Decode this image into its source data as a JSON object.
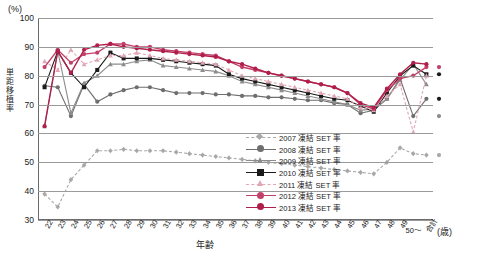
{
  "axis": {
    "y_unit": "(%)",
    "y_title": "単距移植率",
    "x_title": "年齢",
    "x_unit": "(歳)",
    "y_ticks": [
      "100",
      "90",
      "80",
      "70",
      "60",
      "50",
      "40",
      "30"
    ],
    "x_ticks": [
      "22",
      "23",
      "24",
      "25",
      "26",
      "27",
      "28",
      "29",
      "30",
      "31",
      "32",
      "33",
      "34",
      "35",
      "36",
      "37",
      "38",
      "39",
      "40",
      "41",
      "42",
      "43",
      "44",
      "45",
      "46",
      "47",
      "48",
      "49",
      "50～",
      "合計"
    ]
  },
  "legend": [
    {
      "label": "2007 凍結 SET 率",
      "color": "#a8a8a8",
      "marker": "diamond",
      "dash": "3 2"
    },
    {
      "label": "2008 凍結 SET 率",
      "color": "#6e6e6e",
      "marker": "circle",
      "dash": "none"
    },
    {
      "label": "2009 凍結 SET 率",
      "color": "#8c8c8c",
      "marker": "triangle",
      "dash": "none"
    },
    {
      "label": "2010 凍結 SET 率",
      "color": "#1a1a1a",
      "marker": "square",
      "dash": "none"
    },
    {
      "label": "2011 凍結 SET 率",
      "color": "#e0a6b4",
      "marker": "triangle",
      "dash": "3 2"
    },
    {
      "label": "2012 凍結 SET 率",
      "color": "#c2406a",
      "marker": "circle",
      "dash": "none"
    },
    {
      "label": "2013 凍結 SET 率",
      "color": "#b01f4a",
      "marker": "circle",
      "dash": "none"
    }
  ],
  "chart_data": {
    "type": "line",
    "title": "",
    "xlabel": "年齢",
    "ylabel": "単距移植率",
    "ylim": [
      30,
      100
    ],
    "grid": true,
    "legend_position": "inside-lower-right",
    "categories": [
      "22",
      "23",
      "24",
      "25",
      "26",
      "27",
      "28",
      "29",
      "30",
      "31",
      "32",
      "33",
      "34",
      "35",
      "36",
      "37",
      "38",
      "39",
      "40",
      "41",
      "42",
      "43",
      "44",
      "45",
      "46",
      "47",
      "48",
      "49",
      "50～",
      "合計"
    ],
    "series": [
      {
        "name": "2007 凍結 SET 率",
        "color": "#a8a8a8",
        "values": [
          39,
          34.5,
          44,
          49,
          54,
          54,
          54.5,
          54,
          54,
          54,
          53.5,
          53,
          52.5,
          52,
          51.5,
          51,
          50.5,
          50,
          49.5,
          49,
          48.5,
          48,
          47.5,
          47,
          46.5,
          46,
          50,
          55,
          53,
          52.5
        ]
      },
      {
        "name": "2008 凍結 SET 率",
        "color": "#6e6e6e",
        "values": [
          76.5,
          76,
          66,
          77,
          71,
          73.5,
          75,
          76,
          76,
          75,
          74,
          74,
          74,
          73.5,
          73.5,
          73,
          73,
          72.5,
          72.5,
          72,
          71.5,
          71.5,
          70.5,
          70,
          67,
          68,
          72,
          79,
          66,
          72
        ]
      },
      {
        "name": "2009 凍結 SET 率",
        "color": "#8c8c8c",
        "values": [
          62.5,
          88.5,
          67,
          77.5,
          80,
          84,
          84,
          85,
          85.5,
          83.5,
          83,
          82.5,
          82,
          81.5,
          80,
          78,
          77,
          76,
          75,
          74,
          73,
          72,
          71,
          70,
          68,
          68.5,
          72,
          78.5,
          84,
          77
        ]
      },
      {
        "name": "2010 凍結 SET 率",
        "color": "#1a1a1a",
        "values": [
          76,
          88.5,
          81,
          76,
          82,
          88,
          86,
          86,
          86,
          85.5,
          85,
          84.5,
          84,
          83.5,
          80.5,
          79,
          78,
          77,
          76,
          75,
          74,
          73,
          72,
          71.5,
          69.5,
          67.5,
          74,
          80,
          83.5,
          80.5
        ]
      },
      {
        "name": "2011 凍結 SET 率",
        "color": "#e0a6b4",
        "values": [
          85,
          82,
          89,
          84,
          85.5,
          87,
          87,
          88,
          87,
          86,
          85.5,
          85,
          84.5,
          84,
          82,
          80,
          79,
          78,
          77,
          76,
          75,
          74,
          73,
          72,
          69,
          68,
          73,
          77,
          60.5,
          80
        ]
      },
      {
        "name": "2012 凍結 SET 率",
        "color": "#c2406a",
        "values": [
          83,
          89,
          84.5,
          87.5,
          88,
          91,
          91,
          90,
          90,
          89,
          88.5,
          88,
          87.5,
          87,
          85,
          83,
          82,
          81,
          80,
          79,
          78,
          77,
          76,
          74,
          70,
          68.5,
          75,
          79,
          80,
          83
        ]
      },
      {
        "name": "2013 凍結 SET 率",
        "color": "#b01f4a",
        "values": [
          62.5,
          88.5,
          81,
          89,
          90.5,
          91,
          90,
          89.5,
          89,
          88.5,
          88,
          87.5,
          87,
          86.5,
          85,
          84,
          82.5,
          81,
          80,
          79,
          78,
          77,
          76,
          74,
          70.5,
          69,
          75.5,
          80.5,
          84.5,
          84
        ]
      }
    ],
    "summary_points": [
      {
        "series": "2012 凍結 SET 率",
        "x": "合計",
        "y": 83,
        "color": "#c2406a"
      },
      {
        "series": "2010 凍結 SET 率",
        "x": "合計",
        "y": 80.5,
        "color": "#1a1a1a"
      },
      {
        "series": "2008 凍結 SET 率",
        "x": "合計",
        "y": 72,
        "color": "#1a1a1a"
      },
      {
        "series": "2007 凍結 SET 率",
        "x": "合計",
        "y": 66,
        "color": "#8c8c8c"
      },
      {
        "series": "2011 凍結 SET 率",
        "x": "合計",
        "y": 52.5,
        "color": "#a8a8a8"
      }
    ]
  }
}
